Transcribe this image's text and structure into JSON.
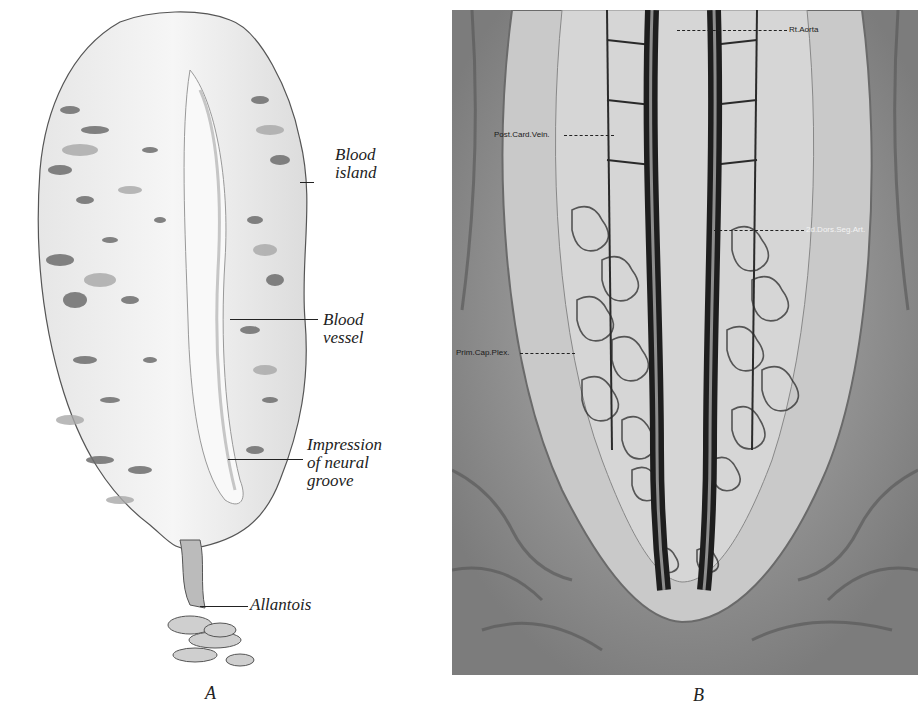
{
  "figure": {
    "panels": [
      {
        "id": "A",
        "caption_letter": "A",
        "labels": [
          {
            "key": "blood_island",
            "line1": "Blood",
            "line2": "island"
          },
          {
            "key": "blood_vessel",
            "line1": "Blood",
            "line2": "vessel"
          },
          {
            "key": "neural_groove",
            "line1": "Impression",
            "line2": "of neural",
            "line3": "groove"
          },
          {
            "key": "allantois",
            "line1": "Allantois"
          }
        ]
      },
      {
        "id": "B",
        "caption_letter": "B",
        "labels": [
          {
            "key": "rt_aorta",
            "text": "Rt.Aorta"
          },
          {
            "key": "post_card_vein",
            "text": "Post.Card.Vein."
          },
          {
            "key": "dors_seg_art",
            "text": "2d.Dors.Seg.Art."
          },
          {
            "key": "prim_cap_plex",
            "text": "Prim.Cap.Plex."
          }
        ]
      }
    ]
  },
  "colors": {
    "ink": "#222222",
    "paper": "#ffffff",
    "embryo_fill": "#eeeeee",
    "island_dark": "#6e6e6e",
    "island_mid": "#a8a8a8",
    "plate_bg": "#8a8a8a",
    "vessel_dark": "#1e1e1e",
    "vessel_light": "#d8d8d8"
  }
}
